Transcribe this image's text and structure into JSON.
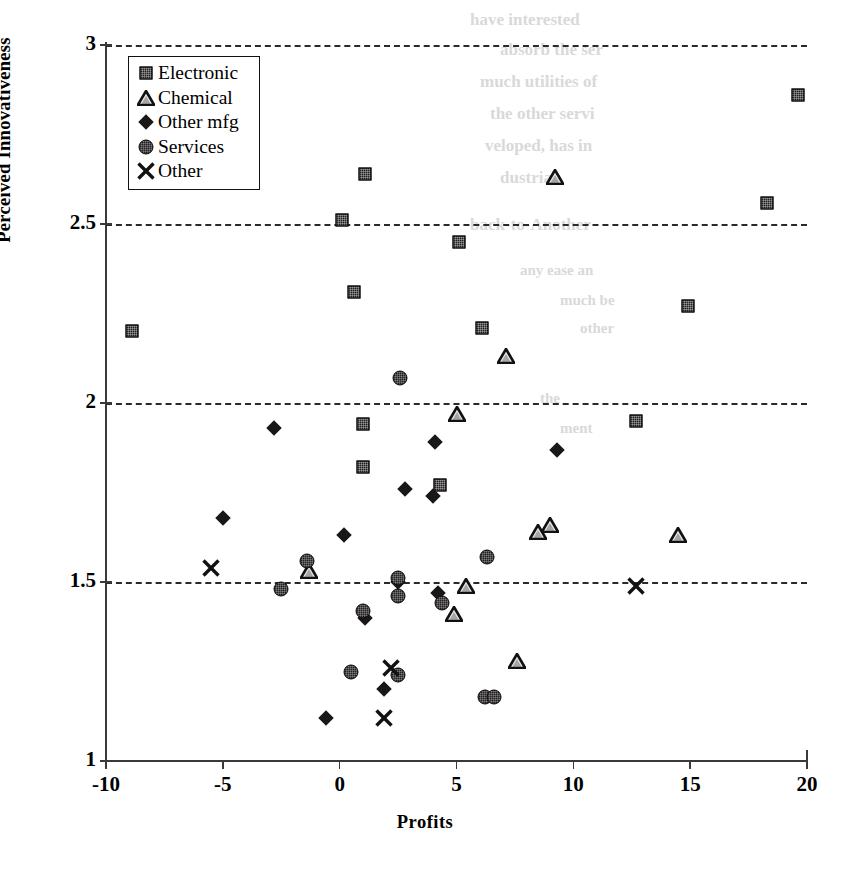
{
  "figure": {
    "type": "scatter-plot",
    "x_title": "Profits",
    "y_title": "Perceived Innovativeness"
  },
  "legend": {
    "items": [
      {
        "label": "Electronic",
        "marker": "square",
        "icon": "filled-square-icon"
      },
      {
        "label": "Chemical",
        "marker": "triangle",
        "icon": "outline-triangle-icon"
      },
      {
        "label": "Other mfg",
        "marker": "diamond",
        "icon": "filled-diamond-icon"
      },
      {
        "label": "Services",
        "marker": "circle",
        "icon": "filled-circle-icon"
      },
      {
        "label": "Other",
        "marker": "cross",
        "icon": "x-cross-icon"
      }
    ]
  },
  "chart_data": {
    "type": "scatter",
    "title": "",
    "xlabel": "Profits",
    "ylabel": "Perceived Innovativeness",
    "xlim": [
      -10,
      20
    ],
    "ylim": [
      1,
      3
    ],
    "xticks": [
      -10,
      -5,
      0,
      5,
      10,
      15,
      20
    ],
    "xtick_labels": [
      "-10",
      "-5",
      "0",
      "5",
      "10",
      "15",
      "20"
    ],
    "yticks": [
      1,
      1.5,
      2,
      2.5,
      3
    ],
    "ytick_labels": [
      "1",
      "1.5",
      "2",
      "2.5",
      "3"
    ],
    "grid": "horizontal-dashed at y = 1.5, 2, 2.5, 3",
    "legend_position": "upper-left-inside",
    "series": [
      {
        "name": "Electronic",
        "marker": "square",
        "points": [
          [
            -8.9,
            2.2
          ],
          [
            0.6,
            2.31
          ],
          [
            1.1,
            2.64
          ],
          [
            0.1,
            2.51
          ],
          [
            6.1,
            2.21
          ],
          [
            5.1,
            2.45
          ],
          [
            14.9,
            2.27
          ],
          [
            18.3,
            2.56
          ],
          [
            19.6,
            2.86
          ],
          [
            1.0,
            1.94
          ],
          [
            1.0,
            1.82
          ],
          [
            4.3,
            1.77
          ],
          [
            12.7,
            1.95
          ]
        ]
      },
      {
        "name": "Chemical",
        "marker": "triangle",
        "points": [
          [
            9.2,
            2.63
          ],
          [
            7.1,
            2.13
          ],
          [
            5.0,
            1.97
          ],
          [
            8.5,
            1.64
          ],
          [
            9.0,
            1.66
          ],
          [
            14.5,
            1.63
          ],
          [
            -1.3,
            1.53
          ],
          [
            5.4,
            1.49
          ],
          [
            4.9,
            1.41
          ],
          [
            7.6,
            1.28
          ]
        ]
      },
      {
        "name": "Other mfg",
        "marker": "diamond",
        "points": [
          [
            -2.8,
            1.93
          ],
          [
            4.1,
            1.89
          ],
          [
            9.3,
            1.87
          ],
          [
            2.8,
            1.76
          ],
          [
            4.0,
            1.74
          ],
          [
            -5.0,
            1.68
          ],
          [
            0.2,
            1.63
          ],
          [
            4.2,
            1.47
          ],
          [
            1.1,
            1.4
          ],
          [
            2.5,
            1.5
          ],
          [
            1.9,
            1.2
          ],
          [
            -0.6,
            1.12
          ]
        ]
      },
      {
        "name": "Services",
        "marker": "circle",
        "points": [
          [
            2.6,
            2.07
          ],
          [
            -1.4,
            1.56
          ],
          [
            -2.5,
            1.48
          ],
          [
            6.3,
            1.57
          ],
          [
            2.5,
            1.51
          ],
          [
            2.5,
            1.46
          ],
          [
            4.4,
            1.44
          ],
          [
            1.0,
            1.42
          ],
          [
            0.5,
            1.25
          ],
          [
            2.5,
            1.24
          ],
          [
            6.2,
            1.18
          ],
          [
            6.6,
            1.18
          ]
        ]
      },
      {
        "name": "Other",
        "marker": "cross",
        "points": [
          [
            -5.5,
            1.54
          ],
          [
            12.7,
            1.49
          ],
          [
            2.2,
            1.26
          ],
          [
            1.9,
            1.12
          ]
        ]
      }
    ]
  },
  "ghost_text": {
    "note": "faint bleed-through of text from the opposite page",
    "lines": [
      {
        "text": "have interested",
        "x": 470,
        "y": 10,
        "size": 17
      },
      {
        "text": "absorb the ser",
        "x": 500,
        "y": 40,
        "size": 17
      },
      {
        "text": "much utilities of",
        "x": 480,
        "y": 72,
        "size": 17
      },
      {
        "text": "the other servi",
        "x": 490,
        "y": 104,
        "size": 17
      },
      {
        "text": "veloped, has in",
        "x": 485,
        "y": 136,
        "size": 17
      },
      {
        "text": "dustrial",
        "x": 500,
        "y": 168,
        "size": 17
      },
      {
        "text": "back-to-Another",
        "x": 470,
        "y": 215,
        "size": 17
      },
      {
        "text": "any ease an",
        "x": 520,
        "y": 262,
        "size": 15
      },
      {
        "text": "much be",
        "x": 560,
        "y": 292,
        "size": 15
      },
      {
        "text": "other",
        "x": 580,
        "y": 320,
        "size": 15
      },
      {
        "text": "the",
        "x": 540,
        "y": 390,
        "size": 15
      },
      {
        "text": "ment",
        "x": 560,
        "y": 420,
        "size": 15
      }
    ]
  }
}
